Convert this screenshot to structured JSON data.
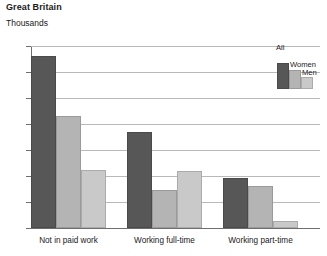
{
  "header": {
    "title": "Great Britain",
    "subtitle": "Thousands"
  },
  "chart_data": {
    "type": "bar",
    "title": "Great Britain",
    "subtitle": "Thousands",
    "xlabel": "",
    "ylabel": "Thousands",
    "ylim": [
      0,
      700
    ],
    "yticks": [
      0,
      100,
      200,
      300,
      400,
      500,
      600,
      700
    ],
    "ytick_labels": [
      "0",
      "100",
      "200",
      "300",
      "400",
      "500",
      "600",
      "700"
    ],
    "grid": true,
    "legend_position": "top-right",
    "categories": [
      "Not in paid work",
      "Working full-time",
      "Working part-time"
    ],
    "series": [
      {
        "name": "All",
        "color": "#575757",
        "values": [
          660,
          370,
          193
        ]
      },
      {
        "name": "Women",
        "color": "#b4b4b4",
        "values": [
          430,
          145,
          163
        ]
      },
      {
        "name": "Men",
        "color": "#c9c9c9",
        "values": [
          225,
          220,
          28
        ]
      }
    ]
  }
}
